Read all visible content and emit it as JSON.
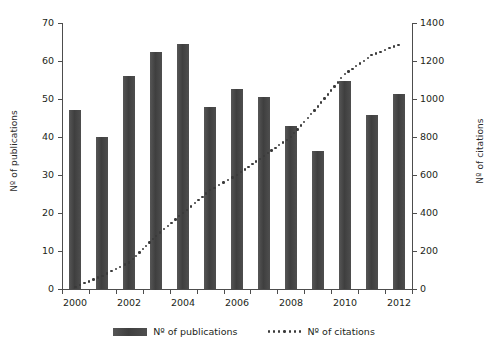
{
  "chart_data": {
    "type": "bar",
    "title": "",
    "xlabel": "",
    "ylabel": "Nº of publications",
    "y2label": "Nº of citations",
    "categories": [
      2000,
      2001,
      2002,
      2003,
      2004,
      2005,
      2006,
      2007,
      2008,
      2009,
      2010,
      2011,
      2012
    ],
    "x_tick_labels": [
      "2000",
      "2002",
      "2004",
      "2006",
      "2008",
      "2010",
      "2012"
    ],
    "y_tick_labels": [
      "0",
      "10",
      "20",
      "30",
      "40",
      "50",
      "60",
      "70"
    ],
    "y2_tick_labels": [
      "0",
      "200",
      "400",
      "600",
      "800",
      "1000",
      "1200",
      "1400"
    ],
    "ylim": [
      0,
      70
    ],
    "y2lim": [
      0,
      1400
    ],
    "grid": false,
    "legend_position": "bottom",
    "series": [
      {
        "name": "Nº of publications",
        "type": "bar",
        "axis": "left",
        "color": "#4a4a4a",
        "values": [
          47,
          40,
          56,
          62.5,
          64.5,
          47.8,
          52.7,
          50.6,
          43,
          36.3,
          54.8,
          45.7,
          51.4
        ]
      },
      {
        "name": "Nº of citations",
        "type": "dotted-line",
        "axis": "right",
        "color": "#3a3a3a",
        "values": [
          10,
          70,
          140,
          280,
          400,
          520,
          600,
          700,
          800,
          960,
          1130,
          1230,
          1285
        ]
      }
    ]
  },
  "legend": {
    "items": [
      {
        "label": "Nº of publications",
        "marker": "bar-swatch"
      },
      {
        "label": "Nº of citations",
        "marker": "dotted-swatch"
      }
    ]
  }
}
